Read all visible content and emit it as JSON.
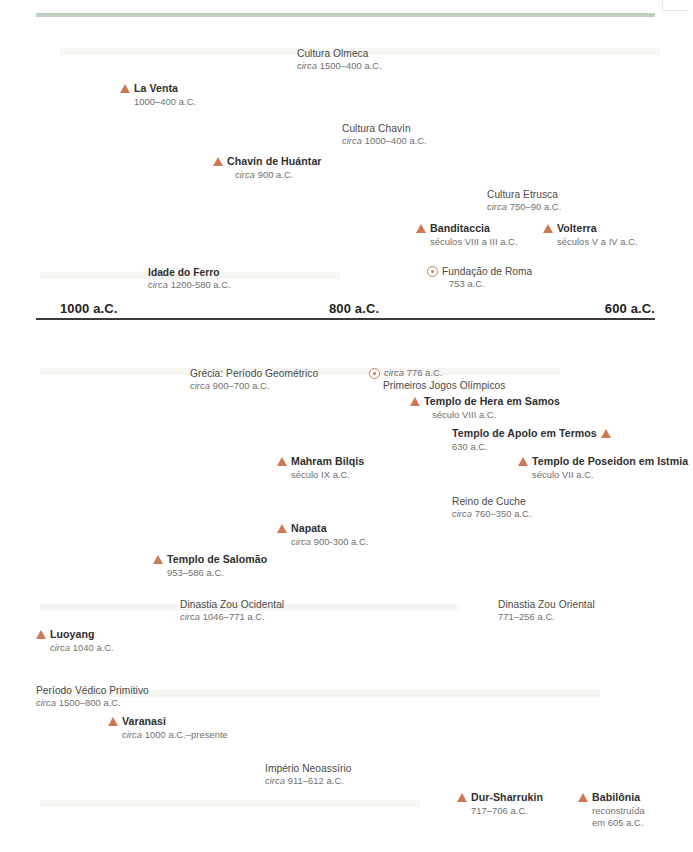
{
  "page": {
    "axis": {
      "ticks": [
        {
          "label": "1000 a.C."
        },
        {
          "label": "800 a.C."
        },
        {
          "label": "600 a.C."
        }
      ]
    }
  },
  "entries": [
    {
      "name": "cultura-olmeca",
      "kind": "period",
      "marker": "none",
      "title": "Cultura Olmeca",
      "date_prefix": "circa",
      "date": "1500–400 a.C."
    },
    {
      "name": "la-venta",
      "kind": "site",
      "marker": "triangle",
      "title": "La Venta",
      "date_prefix": "",
      "date": "1000–400 a.C."
    },
    {
      "name": "cultura-chavin",
      "kind": "period",
      "marker": "none",
      "title": "Cultura Chavín",
      "date_prefix": "circa",
      "date": "1000–400 a.C."
    },
    {
      "name": "chavin-de-huantar",
      "kind": "site",
      "marker": "triangle",
      "title": "Chavín de Huántar",
      "date_prefix": "circa",
      "date": "900 a.C."
    },
    {
      "name": "cultura-etrusca",
      "kind": "period",
      "marker": "none",
      "title": "Cultura Etrusca",
      "date_prefix": "circa",
      "date": "750–90 a.C."
    },
    {
      "name": "banditaccia",
      "kind": "site",
      "marker": "triangle",
      "title": "Banditaccia",
      "date_prefix": "",
      "date": "séculos VIII a III a.C."
    },
    {
      "name": "volterra",
      "kind": "site",
      "marker": "triangle",
      "title": "Volterra",
      "date_prefix": "",
      "date": "séculos V a IV a.C."
    },
    {
      "name": "idade-do-ferro",
      "kind": "period",
      "marker": "none",
      "title": "Idade do Ferro",
      "date_prefix": "circa",
      "date": "1200-580 a.C."
    },
    {
      "name": "fundacao-de-roma",
      "kind": "event",
      "marker": "dot",
      "title": "Fundação de Roma",
      "date_prefix": "",
      "date": "753 a.C."
    },
    {
      "name": "grecia-periodo-geometrico",
      "kind": "period",
      "marker": "none",
      "title": "Grécia: Período Geométrico",
      "date_prefix": "circa",
      "date": "900–700 a.C."
    },
    {
      "name": "primeiros-jogos-olimpicos",
      "kind": "event",
      "marker": "dot",
      "title": "Primeiros Jogos Olímpicos",
      "date_prefix": "circa",
      "date": "776 a.C."
    },
    {
      "name": "templo-de-hera-em-samos",
      "kind": "site",
      "marker": "triangle",
      "title": "Templo de Hera em Samos",
      "date_prefix": "",
      "date": "século VIII a.C."
    },
    {
      "name": "templo-de-apolo-em-termos",
      "kind": "site",
      "marker": "triangle-right",
      "title": "Templo de Apolo em Termos",
      "date_prefix": "",
      "date": "630 a.C."
    },
    {
      "name": "templo-de-poseidon-em-istmia",
      "kind": "site",
      "marker": "triangle",
      "title": "Templo de Poseidon em Istmia",
      "date_prefix": "",
      "date": "século VII a.C."
    },
    {
      "name": "mahram-bilqis",
      "kind": "site",
      "marker": "triangle",
      "title": "Mahram Bilqis",
      "date_prefix": "",
      "date": "século IX a.C."
    },
    {
      "name": "reino-de-cuche",
      "kind": "period",
      "marker": "none",
      "title": "Reino de Cuche",
      "date_prefix": "circa",
      "date": "760–350 a.C."
    },
    {
      "name": "napata",
      "kind": "site",
      "marker": "triangle",
      "title": "Napata",
      "date_prefix": "circa",
      "date": "900-300 a.C."
    },
    {
      "name": "templo-de-salomao",
      "kind": "site",
      "marker": "triangle",
      "title": "Templo de Salomão",
      "date_prefix": "",
      "date": "953–586 a.C."
    },
    {
      "name": "dinastia-zou-ocidental",
      "kind": "period",
      "marker": "none",
      "title": "Dinastia Zou Ocidental",
      "date_prefix": "circa",
      "date": "1046–771 a.C."
    },
    {
      "name": "dinastia-zou-oriental",
      "kind": "period",
      "marker": "none",
      "title": "Dinastia Zou Oriental",
      "date_prefix": "",
      "date": "771–256 a.C."
    },
    {
      "name": "luoyang",
      "kind": "site",
      "marker": "triangle",
      "title": "Luoyang",
      "date_prefix": "circa",
      "date": "1040 a.C."
    },
    {
      "name": "periodo-vedico-primitivo",
      "kind": "period",
      "marker": "none",
      "title": "Período Védico Primitivo",
      "date_prefix": "circa",
      "date": "1500–800 a.C."
    },
    {
      "name": "varanasi",
      "kind": "site",
      "marker": "triangle",
      "title": "Varanasi",
      "date_prefix": "circa",
      "date": "1000 a.C.–presente"
    },
    {
      "name": "imperio-neoassirio",
      "kind": "period",
      "marker": "none",
      "title": "Império Neoassírio",
      "date_prefix": "circa",
      "date": "911–612 a.C."
    },
    {
      "name": "dur-sharrukin",
      "kind": "site",
      "marker": "triangle",
      "title": "Dur-Sharrukin",
      "date_prefix": "",
      "date": "717–706 a.C."
    },
    {
      "name": "babilonia",
      "kind": "site",
      "marker": "triangle",
      "title": "Babilônia",
      "date_prefix": "",
      "date": "reconstruída",
      "date2": "em 605 a.C."
    }
  ],
  "colors": {
    "marker": "#cf7954",
    "rule": "#c3cec3",
    "axis": "#3a3a38",
    "title": "#2f2f2d",
    "date": "#6f6f6d"
  }
}
